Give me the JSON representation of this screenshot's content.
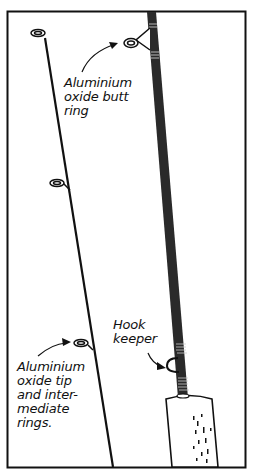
{
  "figure": {
    "colors": {
      "ink": "#111111",
      "background": "#ffffff",
      "blank": "#2a2a2a"
    }
  },
  "labels": {
    "butt_ring": "Aluminium\noxide butt\nring",
    "tip_rings": "Aluminium\noxide tip\nand inter-\nmediate\nrings.",
    "hook_keeper": "Hook\nkeeper"
  }
}
